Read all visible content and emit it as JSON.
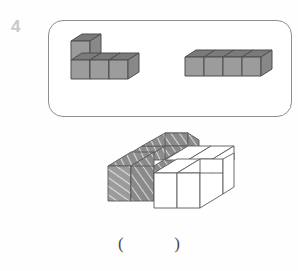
{
  "page": {
    "background_color": "#fefefe",
    "width": 298,
    "height": 271
  },
  "question": {
    "number": "4",
    "number_color": "#c9c9c9"
  },
  "prompt_box": {
    "border_color": "#8f8f8f",
    "fill_color": "#ffffff",
    "pieces": [
      {
        "name": "L-shaped piece",
        "cube_count": 4,
        "description": "Two cubes stacked vertically on the left plus two cubes extending right along the bottom row, forming an L",
        "fill": "solid-gray",
        "face_colors": {
          "top": "#7d7d7d",
          "left": "#9a9a9a",
          "right": "#888888"
        }
      },
      {
        "name": "Straight bar piece",
        "cube_count": 4,
        "description": "Four cubes in a single straight horizontal row",
        "fill": "solid-gray",
        "face_colors": {
          "top": "#7d7d7d",
          "left": "#9a9a9a",
          "right": "#888888"
        }
      }
    ]
  },
  "composite_figure": {
    "description": "Assembled solid made of hatched cubes and plain white cubes",
    "hatched_cube_count": 7,
    "white_cube_count": 5,
    "total_cube_count": 12,
    "hatch_color": "#8a8a8a",
    "white_color": "#ffffff",
    "outline_color": "#5a5a5a"
  },
  "answer": {
    "open_paren": "(",
    "close_paren": ")",
    "value": ""
  }
}
